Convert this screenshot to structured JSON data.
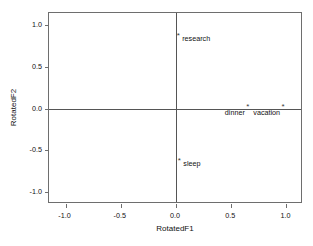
{
  "chart_data": {
    "type": "scatter",
    "title": "",
    "xlabel": "RotatedF1",
    "ylabel": "RotatedF2",
    "xlim": [
      -1.15,
      1.15
    ],
    "ylim": [
      -1.15,
      1.15
    ],
    "xticks": [
      -1.0,
      -0.5,
      0.0,
      0.5,
      1.0
    ],
    "yticks": [
      -1.0,
      -0.5,
      0.0,
      0.5,
      1.0
    ],
    "xticklabels": [
      "-1.0",
      "-0.5",
      "0.0",
      "0.5",
      "1.0"
    ],
    "yticklabels": [
      "1.0",
      "0.5",
      "0.0",
      "-0.5",
      "-1.0"
    ],
    "grid": false,
    "legend": null,
    "reference_lines": {
      "vertical_at_x": 0.0,
      "horizontal_at_y": 0.0
    },
    "marker": "asterisk",
    "points": [
      {
        "label": "research",
        "x": 0.02,
        "y": 0.87,
        "label_side": "right"
      },
      {
        "label": "dinner",
        "x": 0.65,
        "y": 0.02,
        "label_side": "left"
      },
      {
        "label": "vacation",
        "x": 0.97,
        "y": 0.02,
        "label_side": "left"
      },
      {
        "label": "sleep",
        "x": 0.03,
        "y": -0.63,
        "label_side": "right"
      }
    ],
    "marker_glyph": "*",
    "colors": {
      "frame": "#6e6e6e",
      "reference_line": "#555555",
      "marker": "#3a3a3a",
      "text": "#111111",
      "background": "#ffffff"
    }
  }
}
